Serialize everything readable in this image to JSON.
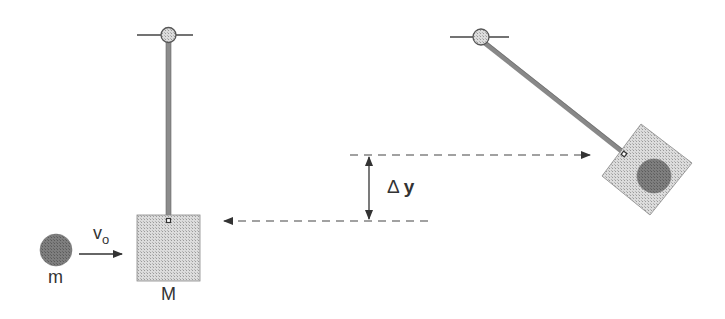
{
  "diagram": {
    "labels": {
      "bullet_mass": "m",
      "velocity": "v",
      "velocity_sub": "o",
      "block_mass": "M",
      "delta": "Δ",
      "height_change": "y"
    },
    "colors": {
      "stroke": "#3a3a3a",
      "rod": "#8a8a8a",
      "pivot": "#8c8c8c",
      "block_fill": "#d4d4d4",
      "ball_fill": "#7a7a7a",
      "dash": "#4a4a4a"
    }
  }
}
